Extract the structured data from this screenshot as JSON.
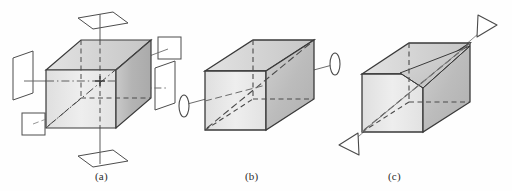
{
  "figure": {
    "kind": "line-drawing",
    "width": 512,
    "height": 191,
    "background_color": "#fefefe"
  },
  "palette": {
    "outline": "#3a3a3a",
    "dashed_edge": "#4a4a4a",
    "axis_line": "#6b6b6b",
    "symbol_stroke": "#4a4a4a",
    "face_top": "#dcdcdc",
    "face_front": "#e9e9e9",
    "face_right": "#b9b9b9",
    "face_near": "#cfcfcf",
    "plane_fill": "#ffffff",
    "caption_color": "#2c2c2c"
  },
  "panels": [
    {
      "id": "a",
      "caption": "(a)",
      "symmetry_elements": [
        {
          "name": "mirror-plane-top",
          "glyph": "parallelogram"
        },
        {
          "name": "mirror-plane-bottom",
          "glyph": "parallelogram"
        },
        {
          "name": "mirror-plane-left",
          "glyph": "parallelogram"
        },
        {
          "name": "mirror-plane-right",
          "glyph": "parallelogram"
        },
        {
          "name": "mirror-plane-upper-right",
          "glyph": "square"
        },
        {
          "name": "mirror-plane-lower-left",
          "glyph": "square"
        },
        {
          "name": "vertical-axis",
          "glyph": "line"
        },
        {
          "name": "horizontal-axis",
          "glyph": "dash-dot-line"
        },
        {
          "name": "diagonal-axis",
          "glyph": "dash-dot-line"
        },
        {
          "name": "inversion-center",
          "glyph": "cross"
        }
      ]
    },
    {
      "id": "b",
      "caption": "(b)",
      "symmetry_elements": [
        {
          "name": "two-fold-axis",
          "glyph": "diagonal-line"
        },
        {
          "name": "lens-symbol-left",
          "glyph": "ellipse"
        },
        {
          "name": "lens-symbol-right",
          "glyph": "ellipse"
        }
      ]
    },
    {
      "id": "c",
      "caption": "(c)",
      "symmetry_elements": [
        {
          "name": "body-diagonal-axis",
          "glyph": "diagonal-line"
        },
        {
          "name": "arrowhead-upper-right",
          "glyph": "open-triangle"
        },
        {
          "name": "arrowhead-lower-left",
          "glyph": "open-triangle"
        },
        {
          "name": "inner-triangle-facet",
          "glyph": "triangle"
        }
      ]
    }
  ],
  "captions": {
    "a": "(a)",
    "b": "(b)",
    "c": "(c)"
  }
}
